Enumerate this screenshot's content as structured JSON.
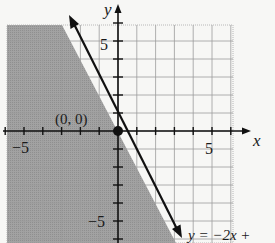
{
  "chart_data": {
    "type": "line",
    "title": "",
    "xlabel": "x",
    "ylabel": "y",
    "xlim": [
      -6,
      6
    ],
    "ylim": [
      -6,
      6
    ],
    "grid": true,
    "x_ticks": [
      -5,
      5
    ],
    "y_ticks": [
      5,
      -5
    ],
    "tick_step": 1,
    "series": [
      {
        "name": "y = -2x +",
        "equation_label": "y = −2x +",
        "slope": -2,
        "intercept": 0,
        "x": [
          -3.1,
          3.2
        ],
        "y": [
          6.2,
          -6.4
        ],
        "style": "solid with arrowheads both ends"
      }
    ],
    "shaded_region": {
      "description": "half-plane left of/below the line y = -2x",
      "inequality": "y <= -2x",
      "color": "#9a9a9a"
    },
    "points": [
      {
        "x": 0,
        "y": 0,
        "label": "(0, 0)",
        "filled": true
      }
    ]
  },
  "labels": {
    "x_axis": "x",
    "y_axis": "y",
    "tick_x_neg5": "−5",
    "tick_x_5": "5",
    "tick_y_5": "5",
    "tick_y_neg5": "−5",
    "origin_point": "(0, 0)",
    "line_equation": "y = −2x +"
  },
  "colors": {
    "shade": "#9a9a9a",
    "grid_light": "#b9b9b9",
    "grid_dark": "#7d7d7d",
    "line": "#111111",
    "background": "#f7f7f5"
  }
}
